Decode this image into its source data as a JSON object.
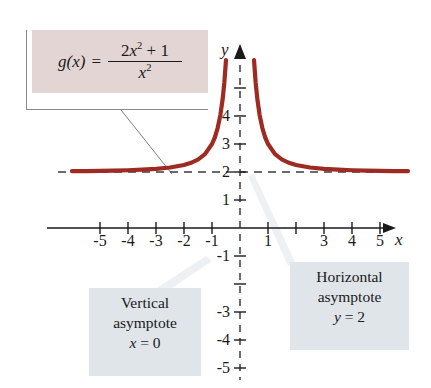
{
  "figure": {
    "kind": "function-graph",
    "background_color": "#ffffff"
  },
  "formula": {
    "function_name": "g",
    "variable": "x",
    "equals": "=",
    "numerator_coeff": "2",
    "numerator_var": "x",
    "numerator_exp": "2",
    "numerator_plus": "+ 1",
    "denominator_var": "x",
    "denominator_exp": "2",
    "box_color": "#e2d5d4",
    "full_text": "g(x) = (2x^2 + 1) / x^2"
  },
  "annotations": {
    "vertical": {
      "line1": "Vertical",
      "line2": "asymptote",
      "line3_var": "x",
      "line3_rest": "= 0",
      "box_color": "#dfe5e9"
    },
    "horizontal": {
      "line1": "Horizontal",
      "line2": "asymptote",
      "line3_var": "y",
      "line3_rest": "= 2",
      "box_color": "#dfe5e9"
    }
  },
  "axes": {
    "x_label": "x",
    "y_label": "y",
    "x_ticks": [
      {
        "value": -5,
        "label": "-5"
      },
      {
        "value": -4,
        "label": "-4"
      },
      {
        "value": -3,
        "label": "-3"
      },
      {
        "value": -2,
        "label": "-2"
      },
      {
        "value": -1,
        "label": "-1"
      },
      {
        "value": 1,
        "label": "1"
      },
      {
        "value": 2,
        "label": ""
      },
      {
        "value": 3,
        "label": "3"
      },
      {
        "value": 4,
        "label": "4"
      },
      {
        "value": 5,
        "label": "5"
      }
    ],
    "y_ticks": [
      {
        "value": 5,
        "label": ""
      },
      {
        "value": 4,
        "label": "4"
      },
      {
        "value": 3,
        "label": "3"
      },
      {
        "value": 2,
        "label": "2"
      },
      {
        "value": 1,
        "label": "1"
      },
      {
        "value": -1,
        "label": "-1"
      },
      {
        "value": -2,
        "label": ""
      },
      {
        "value": -3,
        "label": "-3"
      },
      {
        "value": -4,
        "label": "-4"
      },
      {
        "value": -5,
        "label": "-5"
      }
    ]
  },
  "chart_data": {
    "type": "line",
    "title": "",
    "xlabel": "x",
    "ylabel": "y",
    "xlim": [
      -6.2,
      6.2
    ],
    "ylim": [
      -5.8,
      6.4
    ],
    "grid": false,
    "legend": "none",
    "curve_color": "#9e2a22",
    "asymptote_color": "#3b3b3b",
    "expression": "g(x) = (2x^2 + 1) / x^2",
    "asymptotes": [
      {
        "type": "vertical",
        "equation": "x = 0",
        "value": 0,
        "style": "dashed"
      },
      {
        "type": "horizontal",
        "equation": "y = 2",
        "value": 2,
        "style": "dashed"
      }
    ],
    "series": [
      {
        "name": "g(x) left branch",
        "x": [
          -6.0,
          -5.5,
          -5.0,
          -4.5,
          -4.0,
          -3.5,
          -3.0,
          -2.5,
          -2.0,
          -1.75,
          -1.5,
          -1.25,
          -1.0,
          -0.9,
          -0.8,
          -0.7,
          -0.62,
          -0.56,
          -0.5,
          -0.46,
          -0.43
        ],
        "y": [
          2.028,
          2.033,
          2.04,
          2.049,
          2.063,
          2.082,
          2.111,
          2.16,
          2.25,
          2.327,
          2.444,
          2.64,
          3.0,
          3.235,
          3.563,
          4.041,
          4.602,
          5.189,
          6.0,
          6.726,
          7.409
        ]
      },
      {
        "name": "g(x) right branch",
        "x": [
          0.43,
          0.46,
          0.5,
          0.56,
          0.62,
          0.7,
          0.8,
          0.9,
          1.0,
          1.25,
          1.5,
          1.75,
          2.0,
          2.5,
          3.0,
          3.5,
          4.0,
          4.5,
          5.0,
          5.5,
          6.0
        ],
        "y": [
          7.409,
          6.726,
          6.0,
          5.189,
          4.602,
          4.041,
          3.563,
          3.235,
          3.0,
          2.64,
          2.444,
          2.327,
          2.25,
          2.16,
          2.111,
          2.082,
          2.063,
          2.049,
          2.04,
          2.033,
          2.028
        ]
      }
    ]
  }
}
